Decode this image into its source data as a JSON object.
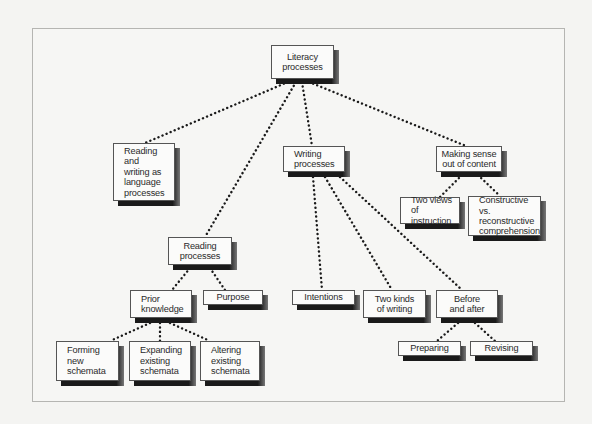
{
  "diagram": {
    "type": "concept-map",
    "root": "Literacy processes",
    "nodes": [
      {
        "id": "literacy",
        "label": "Literacy\nprocesses",
        "x": 271,
        "y": 45,
        "w": 63,
        "h": 34,
        "align": "center"
      },
      {
        "id": "reading-writing-language",
        "label": "Reading and\nwriting as\nlanguage\nprocesses",
        "x": 113,
        "y": 143,
        "w": 62,
        "h": 58,
        "align": "left"
      },
      {
        "id": "writing-processes",
        "label": "Writing\nprocesses",
        "x": 283,
        "y": 146,
        "w": 62,
        "h": 26,
        "align": "left"
      },
      {
        "id": "making-sense",
        "label": "Making sense\nout of content",
        "x": 436,
        "y": 146,
        "w": 66,
        "h": 26,
        "align": "center"
      },
      {
        "id": "two-views",
        "label": "Two views of\ninstruction",
        "x": 400,
        "y": 197,
        "w": 60,
        "h": 27,
        "align": "left"
      },
      {
        "id": "constructive",
        "label": "Constructive vs.\nreconstructive\ncomprehension",
        "x": 468,
        "y": 196,
        "w": 73,
        "h": 40,
        "align": "left"
      },
      {
        "id": "reading-processes",
        "label": "Reading\nprocesses",
        "x": 168,
        "y": 237,
        "w": 64,
        "h": 28,
        "align": "center"
      },
      {
        "id": "prior-knowledge",
        "label": "Prior\nknowledge",
        "x": 130,
        "y": 290,
        "w": 62,
        "h": 28,
        "align": "left"
      },
      {
        "id": "purpose",
        "label": "Purpose",
        "x": 203,
        "y": 290,
        "w": 60,
        "h": 15,
        "align": "center"
      },
      {
        "id": "forming",
        "label": "Forming\nnew\nschemata",
        "x": 56,
        "y": 341,
        "w": 63,
        "h": 40,
        "align": "left"
      },
      {
        "id": "expanding",
        "label": "Expanding\nexisting\nschemata",
        "x": 129,
        "y": 341,
        "w": 62,
        "h": 40,
        "align": "left"
      },
      {
        "id": "altering",
        "label": "Altering\nexisting\nschemata",
        "x": 200,
        "y": 341,
        "w": 60,
        "h": 40,
        "align": "left"
      },
      {
        "id": "intentions",
        "label": "Intentions",
        "x": 292,
        "y": 290,
        "w": 63,
        "h": 15,
        "align": "center"
      },
      {
        "id": "two-kinds",
        "label": "Two kinds\nof writing",
        "x": 363,
        "y": 290,
        "w": 63,
        "h": 28,
        "align": "center"
      },
      {
        "id": "before-after",
        "label": "Before\nand after",
        "x": 436,
        "y": 290,
        "w": 62,
        "h": 28,
        "align": "center"
      },
      {
        "id": "preparing",
        "label": "Preparing",
        "x": 398,
        "y": 341,
        "w": 63,
        "h": 15,
        "align": "center"
      },
      {
        "id": "revising",
        "label": "Revising",
        "x": 470,
        "y": 341,
        "w": 63,
        "h": 15,
        "align": "center"
      }
    ],
    "edges": [
      {
        "from": "literacy",
        "to": "reading-writing-language",
        "x1": 288,
        "y1": 82,
        "x2": 145,
        "y2": 143
      },
      {
        "from": "literacy",
        "to": "reading-processes",
        "x1": 296,
        "y1": 82,
        "x2": 205,
        "y2": 237
      },
      {
        "from": "literacy",
        "to": "writing-processes",
        "x1": 302,
        "y1": 82,
        "x2": 312,
        "y2": 146
      },
      {
        "from": "literacy",
        "to": "making-sense",
        "x1": 309,
        "y1": 82,
        "x2": 466,
        "y2": 146
      },
      {
        "from": "making-sense",
        "to": "two-views",
        "x1": 462,
        "y1": 175,
        "x2": 440,
        "y2": 197
      },
      {
        "from": "making-sense",
        "to": "constructive",
        "x1": 478,
        "y1": 175,
        "x2": 500,
        "y2": 196
      },
      {
        "from": "writing-processes",
        "to": "intentions",
        "x1": 313,
        "y1": 177,
        "x2": 322,
        "y2": 290
      },
      {
        "from": "writing-processes",
        "to": "two-kinds",
        "x1": 325,
        "y1": 177,
        "x2": 392,
        "y2": 290
      },
      {
        "from": "writing-processes",
        "to": "before-after",
        "x1": 340,
        "y1": 177,
        "x2": 462,
        "y2": 290
      },
      {
        "from": "reading-processes",
        "to": "prior-knowledge",
        "x1": 190,
        "y1": 268,
        "x2": 172,
        "y2": 290
      },
      {
        "from": "reading-processes",
        "to": "purpose",
        "x1": 210,
        "y1": 268,
        "x2": 225,
        "y2": 290
      },
      {
        "from": "prior-knowledge",
        "to": "forming",
        "x1": 150,
        "y1": 323,
        "x2": 110,
        "y2": 341
      },
      {
        "from": "prior-knowledge",
        "to": "expanding",
        "x1": 160,
        "y1": 323,
        "x2": 160,
        "y2": 341
      },
      {
        "from": "prior-knowledge",
        "to": "altering",
        "x1": 170,
        "y1": 323,
        "x2": 210,
        "y2": 341
      },
      {
        "from": "before-after",
        "to": "preparing",
        "x1": 458,
        "y1": 323,
        "x2": 437,
        "y2": 341
      },
      {
        "from": "before-after",
        "to": "revising",
        "x1": 475,
        "y1": 323,
        "x2": 495,
        "y2": 341
      }
    ]
  },
  "colors": {
    "background": "#f4f4f2",
    "frame_border": "#b5b5b2",
    "box_fill": "#fbfbfa",
    "box_border": "#555555",
    "shadow": "#1a1a1a",
    "dots": "#1a1a1a",
    "text": "#2a2a2a"
  }
}
